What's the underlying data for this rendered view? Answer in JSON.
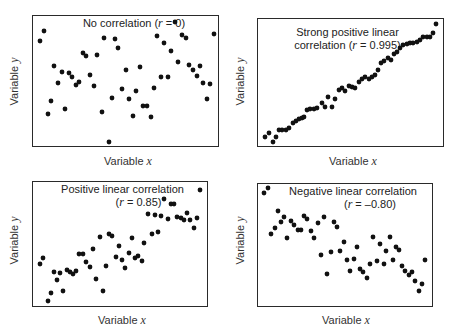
{
  "chart_data": [
    {
      "type": "scatter",
      "title": "No correlation (r = 0)",
      "title_parts": [
        "No correlation (",
        "r",
        " = 0)"
      ],
      "xlabel": "Variable x",
      "ylabel": "Variable y",
      "correlation_r": 0,
      "grid": false,
      "box": {
        "left": 32,
        "top": 15,
        "width": 187,
        "height": 132
      },
      "title_pos": {
        "left": 60,
        "top": 16,
        "width": 140
      },
      "xlabel_pos": {
        "left": 100,
        "top": 154
      },
      "ylabel_pos": {
        "left": -8,
        "top": 75
      },
      "points_px": [
        [
          40,
          41
        ],
        [
          44,
          31
        ],
        [
          48,
          114
        ],
        [
          51,
          101
        ],
        [
          54,
          66
        ],
        [
          58,
          83
        ],
        [
          62,
          72
        ],
        [
          65,
          109
        ],
        [
          69,
          73
        ],
        [
          72,
          77
        ],
        [
          76,
          85
        ],
        [
          79,
          82
        ],
        [
          83,
          53
        ],
        [
          86,
          56
        ],
        [
          90,
          75
        ],
        [
          94,
          86
        ],
        [
          97,
          55
        ],
        [
          102,
          112
        ],
        [
          104,
          38
        ],
        [
          109,
          142
        ],
        [
          112,
          98
        ],
        [
          115,
          39
        ],
        [
          118,
          48
        ],
        [
          122,
          89
        ],
        [
          126,
          70
        ],
        [
          129,
          99
        ],
        [
          133,
          116
        ],
        [
          136,
          91
        ],
        [
          140,
          67
        ],
        [
          143,
          106
        ],
        [
          147,
          106
        ],
        [
          151,
          117
        ],
        [
          154,
          88
        ],
        [
          157,
          36
        ],
        [
          161,
          77
        ],
        [
          164,
          43
        ],
        [
          168,
          77
        ],
        [
          171,
          51
        ],
        [
          175,
          22
        ],
        [
          178,
          62
        ],
        [
          182,
          35
        ],
        [
          186,
          38
        ],
        [
          189,
          65
        ],
        [
          193,
          70
        ],
        [
          197,
          76
        ],
        [
          200,
          66
        ],
        [
          203,
          83
        ],
        [
          207,
          99
        ],
        [
          210,
          84
        ],
        [
          214,
          34
        ]
      ]
    },
    {
      "type": "scatter",
      "title": "Strong positive linear correlation (r = 0.995)",
      "title_lines": [
        "Strong positive linear",
        "correlation ("
      ],
      "title_parts": [
        "correlation (",
        "r",
        " = 0.995)"
      ],
      "xlabel": "Variable x",
      "ylabel": "Variable y",
      "correlation_r": 0.995,
      "grid": false,
      "box": {
        "left": 257,
        "top": 18,
        "width": 187,
        "height": 129
      },
      "title_pos": {
        "left": 280,
        "top": 25,
        "width": 130
      },
      "xlabel_pos": {
        "left": 327,
        "top": 154
      },
      "ylabel_pos": {
        "left": 218,
        "top": 75
      },
      "points_px": [
        [
          265,
          137
        ],
        [
          269,
          133
        ],
        [
          273,
          142
        ],
        [
          276,
          137
        ],
        [
          279,
          130
        ],
        [
          282,
          130
        ],
        [
          286,
          130
        ],
        [
          289,
          128
        ],
        [
          293,
          123
        ],
        [
          296,
          121
        ],
        [
          299,
          119
        ],
        [
          302,
          118
        ],
        [
          304,
          117
        ],
        [
          307,
          110
        ],
        [
          310,
          109
        ],
        [
          314,
          109
        ],
        [
          317,
          108
        ],
        [
          322,
          103
        ],
        [
          325,
          107
        ],
        [
          328,
          97
        ],
        [
          332,
          107
        ],
        [
          335,
          99
        ],
        [
          339,
          90
        ],
        [
          342,
          88
        ],
        [
          345,
          91
        ],
        [
          349,
          86
        ],
        [
          352,
          87
        ],
        [
          355,
          88
        ],
        [
          359,
          82
        ],
        [
          362,
          79
        ],
        [
          365,
          77
        ],
        [
          369,
          79
        ],
        [
          372,
          77
        ],
        [
          375,
          75
        ],
        [
          378,
          70
        ],
        [
          381,
          63
        ],
        [
          384,
          61
        ],
        [
          388,
          58
        ],
        [
          391,
          60
        ],
        [
          394,
          54
        ],
        [
          397,
          52
        ],
        [
          400,
          48
        ],
        [
          403,
          45
        ],
        [
          407,
          44
        ],
        [
          410,
          43
        ],
        [
          413,
          43
        ],
        [
          417,
          42
        ],
        [
          420,
          40
        ],
        [
          423,
          37
        ],
        [
          427,
          37
        ],
        [
          430,
          37
        ],
        [
          433,
          33
        ],
        [
          436,
          24
        ]
      ]
    },
    {
      "type": "scatter",
      "title": "Positive linear correlation (r = 0.85)",
      "title_lines": [
        "Positive linear correlation"
      ],
      "title_parts": [
        "(",
        "r",
        " = 0.85)"
      ],
      "xlabel": "Variable x",
      "ylabel": "Variable y",
      "correlation_r": 0.85,
      "grid": false,
      "box": {
        "left": 32,
        "top": 181,
        "width": 176,
        "height": 126
      },
      "title_pos": {
        "left": 55,
        "top": 183,
        "width": 130
      },
      "xlabel_pos": {
        "left": 96,
        "top": 313
      },
      "ylabel_pos": {
        "left": -8,
        "top": 233
      },
      "points_px": [
        [
          40,
          264
        ],
        [
          43,
          258
        ],
        [
          48,
          301
        ],
        [
          51,
          293
        ],
        [
          54,
          272
        ],
        [
          57,
          280
        ],
        [
          60,
          273
        ],
        [
          63,
          291
        ],
        [
          67,
          270
        ],
        [
          70,
          272
        ],
        [
          73,
          274
        ],
        [
          76,
          271
        ],
        [
          79,
          254
        ],
        [
          83,
          254
        ],
        [
          86,
          262
        ],
        [
          90,
          267
        ],
        [
          93,
          249
        ],
        [
          96,
          279
        ],
        [
          100,
          237
        ],
        [
          103,
          291
        ],
        [
          106,
          266
        ],
        [
          109,
          234
        ],
        [
          112,
          236
        ],
        [
          116,
          257
        ],
        [
          119,
          246
        ],
        [
          122,
          260
        ],
        [
          125,
          268
        ],
        [
          129,
          253
        ],
        [
          132,
          238
        ],
        [
          135,
          258
        ],
        [
          138,
          256
        ],
        [
          142,
          261
        ],
        [
          144,
          243
        ],
        [
          148,
          214
        ],
        [
          152,
          234
        ],
        [
          155,
          215
        ],
        [
          158,
          232
        ],
        [
          161,
          216
        ],
        [
          164,
          199
        ],
        [
          168,
          219
        ],
        [
          171,
          204
        ],
        [
          174,
          204
        ],
        [
          177,
          217
        ],
        [
          181,
          218
        ],
        [
          184,
          220
        ],
        [
          187,
          213
        ],
        [
          190,
          220
        ],
        [
          194,
          228
        ],
        [
          197,
          218
        ],
        [
          200,
          190
        ]
      ]
    },
    {
      "type": "scatter",
      "title": "Negative linear correlation (r = –0.80)",
      "title_lines": [
        "Negative linear correlation"
      ],
      "title_parts": [
        "(",
        "r",
        " = –0.80)"
      ],
      "xlabel": "Variable x",
      "ylabel": "Variable y",
      "correlation_r": -0.8,
      "grid": false,
      "box": {
        "left": 257,
        "top": 183,
        "width": 176,
        "height": 124
      },
      "title_pos": {
        "left": 280,
        "top": 184,
        "width": 145
      },
      "xlabel_pos": {
        "left": 322,
        "top": 313
      },
      "ylabel_pos": {
        "left": 218,
        "top": 233
      },
      "points_px": [
        [
          264,
          193
        ],
        [
          268,
          188
        ],
        [
          271,
          234
        ],
        [
          275,
          228
        ],
        [
          278,
          211
        ],
        [
          281,
          222
        ],
        [
          284,
          217
        ],
        [
          287,
          238
        ],
        [
          291,
          221
        ],
        [
          294,
          225
        ],
        [
          298,
          230
        ],
        [
          301,
          230
        ],
        [
          304,
          216
        ],
        [
          307,
          219
        ],
        [
          311,
          231
        ],
        [
          314,
          238
        ],
        [
          318,
          223
        ],
        [
          321,
          255
        ],
        [
          324,
          217
        ],
        [
          327,
          274
        ],
        [
          331,
          252
        ],
        [
          334,
          222
        ],
        [
          337,
          227
        ],
        [
          340,
          251
        ],
        [
          344,
          242
        ],
        [
          347,
          260
        ],
        [
          350,
          271
        ],
        [
          354,
          259
        ],
        [
          357,
          247
        ],
        [
          360,
          269
        ],
        [
          363,
          272
        ],
        [
          367,
          278
        ],
        [
          370,
          264
        ],
        [
          373,
          237
        ],
        [
          377,
          261
        ],
        [
          380,
          244
        ],
        [
          384,
          264
        ],
        [
          386,
          251
        ],
        [
          390,
          237
        ],
        [
          393,
          260
        ],
        [
          396,
          247
        ],
        [
          399,
          250
        ],
        [
          402,
          266
        ],
        [
          405,
          271
        ],
        [
          409,
          275
        ],
        [
          412,
          272
        ],
        [
          415,
          281
        ],
        [
          419,
          291
        ],
        [
          422,
          284
        ],
        [
          425,
          260
        ]
      ]
    }
  ],
  "style": {
    "point_color": "#111111",
    "point_radius": 2.4,
    "box_color": "#2a2a2a",
    "background": "#ffffff"
  },
  "labels": {
    "p1": {
      "title_pre": "No correlation (",
      "r": "r",
      "title_post": " = 0)"
    },
    "p2": {
      "line1": "Strong positive linear",
      "title_pre": "correlation (",
      "r": "r",
      "title_post": " = 0.995)"
    },
    "p3": {
      "line1": "Positive linear correlation",
      "title_pre": "(",
      "r": "r",
      "title_post": " = 0.85)"
    },
    "p4": {
      "line1": "Negative linear correlation",
      "title_pre": "(",
      "r": "r",
      "title_post": " = –0.80)"
    },
    "xlabel_word": "Variable",
    "xlabel_var": "x",
    "ylabel_word": "Variable",
    "ylabel_var": "y"
  }
}
